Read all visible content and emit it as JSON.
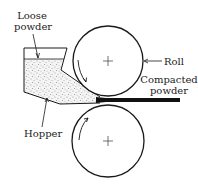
{
  "diagram": {
    "labels": {
      "loose_powder_line1": "Loose",
      "loose_powder_line2": "powder",
      "roll": "Roll",
      "compacted_line1": "Compacted",
      "compacted_line2": "powder",
      "hopper": "Hopper"
    },
    "components": [
      {
        "id": "top-roll",
        "type": "circle",
        "rotation": "counter-clockwise"
      },
      {
        "id": "bottom-roll",
        "type": "circle",
        "rotation": "clockwise"
      },
      {
        "id": "hopper",
        "type": "container",
        "contents": "loose powder"
      },
      {
        "id": "compacted-strip",
        "type": "output",
        "contents": "compacted powder"
      }
    ],
    "colors": {
      "line": "#1a1a1a",
      "powder_fill": "#f2f2f2",
      "powder_dots": "#555555",
      "strip": "#111111"
    }
  }
}
